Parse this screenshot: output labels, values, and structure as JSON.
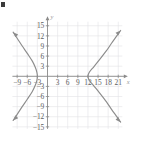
{
  "figure": {
    "corner_mark": "decorative-black-square",
    "axis_labels": {
      "x": "x",
      "y": "y"
    },
    "x_ticks": [
      {
        "value": -9,
        "label": "−9"
      },
      {
        "value": -6,
        "label": "−6"
      },
      {
        "value": -3,
        "label": "−3"
      },
      {
        "value": 3,
        "label": "3"
      },
      {
        "value": 6,
        "label": "6"
      },
      {
        "value": 9,
        "label": "9"
      },
      {
        "value": 12,
        "label": "12"
      },
      {
        "value": 15,
        "label": "15"
      },
      {
        "value": 18,
        "label": "18"
      },
      {
        "value": 21,
        "label": "21"
      }
    ],
    "y_ticks": [
      {
        "value": 15,
        "label": "15"
      },
      {
        "value": 12,
        "label": "12"
      },
      {
        "value": 9,
        "label": "9"
      },
      {
        "value": 6,
        "label": "6"
      },
      {
        "value": 3,
        "label": "3"
      },
      {
        "value": -3,
        "label": "−3"
      },
      {
        "value": -6,
        "label": "−6"
      },
      {
        "value": -9,
        "label": "−9"
      },
      {
        "value": -12,
        "label": "−12"
      },
      {
        "value": -15,
        "label": "−15"
      }
    ],
    "colors": {
      "grid": "#e3e3e6",
      "axis": "#8a8a8a",
      "curve": "#8c8c8c",
      "tick_text": "#5d5d5d",
      "axis_name": "#9a9a9a",
      "background": "#ffffff"
    }
  },
  "chart_data": {
    "type": "line",
    "title": "",
    "xlabel": "x",
    "ylabel": "y",
    "xlim": [
      -10.5,
      22.5
    ],
    "ylim": [
      -15.8,
      16.5
    ],
    "grid": true,
    "grid_step": 3,
    "legend": "none",
    "curve": {
      "shape": "hyperbola",
      "center": [
        4.5,
        0
      ],
      "vertices": [
        [
          -3,
          0
        ],
        [
          12,
          0
        ]
      ],
      "a": 7.5,
      "b": 7.5,
      "asymptote_slopes": [
        1,
        -1
      ],
      "arrows": [
        "up-left",
        "down-left",
        "up-right",
        "down-right"
      ]
    },
    "series": [
      {
        "name": "left-branch",
        "points": [
          [
            -10.2,
            13.1
          ],
          [
            -9.0,
            11.3
          ],
          [
            -7.5,
            9.0
          ],
          [
            -6.0,
            6.8
          ],
          [
            -4.5,
            4.5
          ],
          [
            -3.6,
            2.6
          ],
          [
            -3.15,
            1.2
          ],
          [
            -3.0,
            0.0
          ],
          [
            -3.15,
            -1.2
          ],
          [
            -3.6,
            -2.6
          ],
          [
            -4.5,
            -4.5
          ],
          [
            -6.0,
            -6.8
          ],
          [
            -7.5,
            -9.0
          ],
          [
            -9.0,
            -11.3
          ],
          [
            -10.2,
            -13.1
          ]
        ]
      },
      {
        "name": "right-branch",
        "points": [
          [
            21.7,
            13.6
          ],
          [
            20.5,
            11.9
          ],
          [
            19.0,
            9.8
          ],
          [
            17.5,
            7.6
          ],
          [
            15.5,
            5.0
          ],
          [
            13.8,
            2.9
          ],
          [
            12.4,
            1.2
          ],
          [
            12.0,
            0.0
          ],
          [
            12.4,
            -1.2
          ],
          [
            13.8,
            -2.9
          ],
          [
            15.5,
            -5.0
          ],
          [
            17.5,
            -7.6
          ],
          [
            19.0,
            -9.8
          ],
          [
            20.5,
            -11.9
          ],
          [
            21.7,
            -13.6
          ]
        ]
      }
    ]
  }
}
